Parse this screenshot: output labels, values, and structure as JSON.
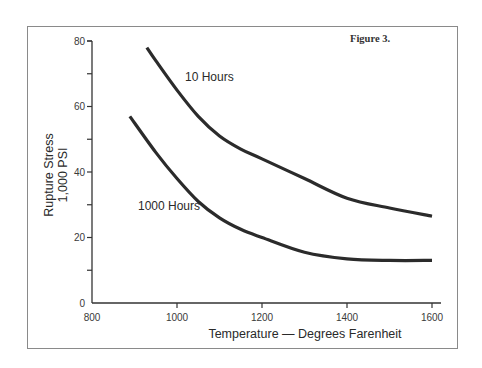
{
  "figure_label": "Figure 3.",
  "chart_data": {
    "type": "line",
    "title": "Figure 3.",
    "xlabel": "Temperature — Degrees Farenheit",
    "ylabel": [
      "Rupture Stress",
      "1,000 PSI"
    ],
    "xlim": [
      800,
      1600
    ],
    "ylim": [
      0,
      80
    ],
    "x_ticks": [
      800,
      1000,
      1200,
      1400,
      1600
    ],
    "x_tick_labels": [
      "800",
      "1000",
      "1200",
      "1400",
      "1600"
    ],
    "y_ticks": [
      0,
      10,
      20,
      30,
      40,
      50,
      60,
      70,
      80
    ],
    "y_tick_labels": [
      "0",
      "",
      "20",
      "",
      "40",
      "",
      "60",
      "",
      "80"
    ],
    "grid": false,
    "legend": "inline labels",
    "series": [
      {
        "name": "10 Hours",
        "x": [
          929,
          950,
          1000,
          1050,
          1100,
          1150,
          1200,
          1300,
          1400,
          1500,
          1600
        ],
        "values": [
          78,
          74,
          65,
          57,
          51,
          47,
          44,
          38,
          32,
          29,
          26.5
        ]
      },
      {
        "name": "1000 Hours",
        "x": [
          889,
          950,
          1000,
          1050,
          1100,
          1150,
          1200,
          1300,
          1400,
          1500,
          1600
        ],
        "values": [
          57,
          46,
          38,
          31,
          26,
          22.5,
          20,
          15.5,
          13.5,
          13,
          13
        ]
      }
    ],
    "annotations": [
      {
        "text": "10 Hours",
        "x": 1020,
        "y": 70
      },
      {
        "text": "1000 Hours",
        "x": 970,
        "y": 30
      }
    ]
  }
}
